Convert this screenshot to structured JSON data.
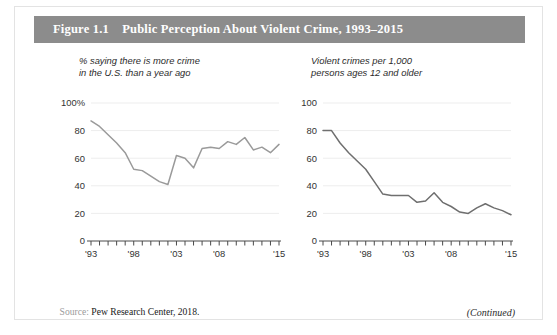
{
  "figure": {
    "label": "Figure 1.1",
    "title": "Public Perception About Violent Crime, 1993–2015",
    "header_full": "Figure 1.1    Public Perception About Violent Crime, 1993–2015",
    "header_bg_color": "#8c8c8c",
    "header_text_color": "#ffffff",
    "border_color": "#e3e3e3"
  },
  "source": {
    "label": "Source:",
    "text": "Pew Research Center, 2018.",
    "full": "Source: Pew Research Center, 2018."
  },
  "continued": {
    "label": "(Continued)"
  },
  "chart_data": [
    {
      "id": "left-panel",
      "type": "line",
      "title": "% saying there is more crime\nin the U.S. than a year ago",
      "xlabel": "",
      "ylabel": "",
      "ylim": [
        0,
        100
      ],
      "yticks": [
        0,
        20,
        40,
        60,
        80,
        100
      ],
      "ytick_labels": [
        "0",
        "20",
        "40",
        "60",
        "80",
        "100%"
      ],
      "xlim": [
        1993,
        2015
      ],
      "xticks": [
        1993,
        1994,
        1995,
        1996,
        1997,
        1998,
        1999,
        2000,
        2001,
        2002,
        2003,
        2004,
        2005,
        2006,
        2007,
        2008,
        2009,
        2010,
        2011,
        2012,
        2013,
        2014,
        2015
      ],
      "xtick_labels": [
        "'93",
        "'98",
        "'03",
        "'08",
        "'15"
      ],
      "xtick_label_years": [
        1993,
        1998,
        2003,
        2008,
        2015
      ],
      "grid": true,
      "line_color": "#9a9a9a",
      "x": [
        1993,
        1994,
        1995,
        1996,
        1997,
        1998,
        1999,
        2000,
        2001,
        2002,
        2003,
        2004,
        2005,
        2006,
        2007,
        2008,
        2009,
        2010,
        2011,
        2012,
        2013,
        2014,
        2015
      ],
      "values": [
        87,
        83,
        77,
        71,
        64,
        52,
        51,
        47,
        43,
        41,
        62,
        60,
        53,
        67,
        68,
        67,
        72,
        70,
        75,
        66,
        68,
        64,
        70
      ],
      "legend": null
    },
    {
      "id": "right-panel",
      "type": "line",
      "title": "Violent crimes per 1,000\npersons ages 12 and older",
      "xlabel": "",
      "ylabel": "",
      "ylim": [
        0,
        100
      ],
      "yticks": [
        0,
        20,
        40,
        60,
        80,
        100
      ],
      "ytick_labels": [
        "0",
        "20",
        "40",
        "60",
        "80",
        "100"
      ],
      "xlim": [
        1993,
        2015
      ],
      "xticks": [
        1993,
        1994,
        1995,
        1996,
        1997,
        1998,
        1999,
        2000,
        2001,
        2002,
        2003,
        2004,
        2005,
        2006,
        2007,
        2008,
        2009,
        2010,
        2011,
        2012,
        2013,
        2014,
        2015
      ],
      "xtick_labels": [
        "'93",
        "'98",
        "'03",
        "'08",
        "'15"
      ],
      "xtick_label_years": [
        1993,
        1998,
        2003,
        2008,
        2015
      ],
      "grid": true,
      "line_color": "#6f6f6f",
      "x": [
        1993,
        1994,
        1995,
        1996,
        1997,
        1998,
        1999,
        2000,
        2001,
        2002,
        2003,
        2004,
        2005,
        2006,
        2007,
        2008,
        2009,
        2010,
        2011,
        2012,
        2013,
        2014,
        2015
      ],
      "values": [
        80,
        80,
        71,
        64,
        58,
        52,
        43,
        34,
        33,
        33,
        33,
        28,
        29,
        35,
        28,
        25,
        21,
        20,
        24,
        27,
        24,
        22,
        19
      ],
      "legend": null
    }
  ]
}
